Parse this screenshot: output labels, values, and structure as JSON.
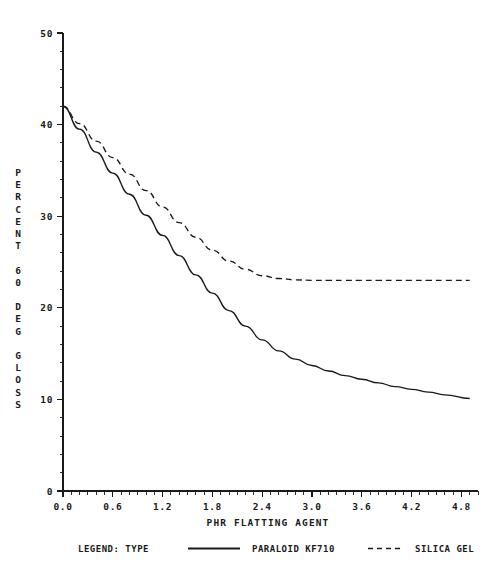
{
  "chart_data": {
    "type": "line",
    "title": "",
    "xlabel": "PHR FLATTING AGENT",
    "ylabel": "PERCENT 60 DEG GLOSS",
    "ylabel_lines": [
      "P",
      "E",
      "R",
      "C",
      "E",
      "N",
      "T",
      "",
      "6",
      "0",
      "",
      "D",
      "E",
      "G",
      "",
      "G",
      "L",
      "O",
      "S",
      "S"
    ],
    "xlim": [
      0.0,
      5.0
    ],
    "ylim": [
      0,
      50
    ],
    "xticks": [
      0.0,
      0.6,
      1.2,
      1.8,
      2.4,
      3.0,
      3.6,
      4.2,
      4.8
    ],
    "xticklabels": [
      "0.0",
      "0.6",
      "1.2",
      "1.8",
      "2.4",
      "3.0",
      "3.6",
      "4.2",
      "4.8"
    ],
    "yticks": [
      0,
      10,
      20,
      30,
      40,
      50
    ],
    "yticklabels": [
      "0",
      "10",
      "20",
      "30",
      "40",
      "50"
    ],
    "x_minor_step": 0.1,
    "y_minor_step": 2,
    "grid": false,
    "legend_position": "below-axis",
    "legend_title": "LEGEND: TYPE",
    "series": [
      {
        "name": "PARALOID KF710",
        "style": "solid",
        "color": "#1a1a1a",
        "x": [
          0.0,
          0.2,
          0.4,
          0.6,
          0.8,
          1.0,
          1.2,
          1.4,
          1.6,
          1.8,
          2.0,
          2.2,
          2.4,
          2.6,
          2.8,
          3.0,
          3.2,
          3.4,
          3.6,
          3.8,
          4.0,
          4.2,
          4.4,
          4.6,
          4.9
        ],
        "y": [
          42.0,
          39.5,
          37.0,
          34.7,
          32.4,
          30.1,
          27.9,
          25.7,
          23.6,
          21.6,
          19.7,
          18.0,
          16.5,
          15.3,
          14.4,
          13.7,
          13.1,
          12.6,
          12.2,
          11.8,
          11.4,
          11.1,
          10.8,
          10.5,
          10.1
        ]
      },
      {
        "name": "SILICA GEL",
        "style": "dashed",
        "color": "#1a1a1a",
        "x": [
          0.0,
          0.2,
          0.4,
          0.6,
          0.8,
          1.0,
          1.2,
          1.4,
          1.6,
          1.8,
          2.0,
          2.2,
          2.4,
          2.6,
          2.8,
          3.0,
          3.2,
          3.4,
          3.6,
          3.8,
          4.0,
          4.2,
          4.4,
          4.6,
          4.9
        ],
        "y": [
          42.0,
          40.1,
          38.2,
          36.4,
          34.6,
          32.8,
          31.0,
          29.3,
          27.7,
          26.3,
          25.1,
          24.2,
          23.5,
          23.2,
          23.05,
          23.0,
          23.0,
          23.0,
          23.0,
          23.0,
          23.0,
          23.0,
          23.0,
          23.0,
          23.0
        ]
      }
    ]
  },
  "legend": {
    "title": "LEGEND: TYPE",
    "entries": [
      {
        "label": "PARALOID KF710",
        "style": "solid"
      },
      {
        "label": "SILICA GEL",
        "style": "dashed"
      }
    ]
  },
  "caption": {
    "text": "",
    "note": ""
  }
}
